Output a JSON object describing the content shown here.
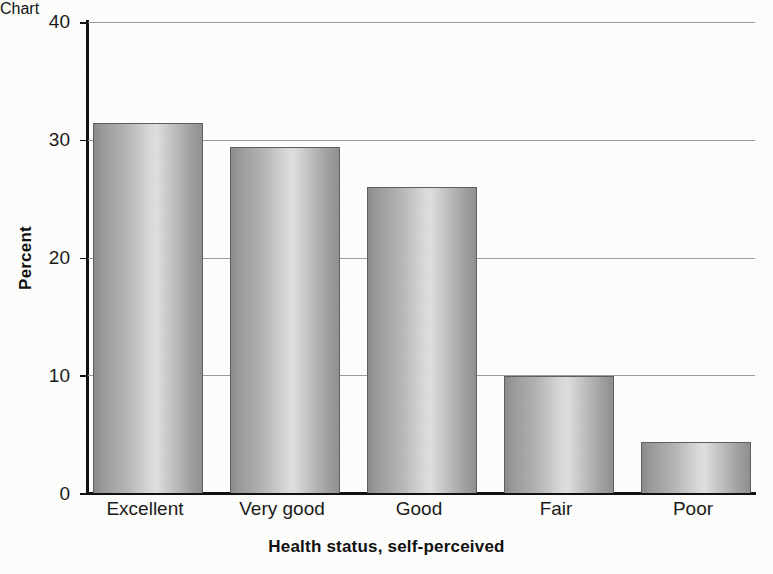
{
  "chart_data": {
    "type": "bar",
    "title": "",
    "xlabel": "Health status, self-perceived",
    "ylabel": "Percent",
    "categories": [
      "Excellent",
      "Very good",
      "Good",
      "Fair",
      "Poor"
    ],
    "values": [
      31.4,
      29.4,
      26.0,
      9.9,
      4.3
    ],
    "ylim": [
      0,
      40
    ],
    "yticks": [
      0,
      10,
      20,
      30,
      40
    ],
    "ytick_labels": [
      "0",
      "10",
      "20",
      "30",
      "40"
    ],
    "grid": true,
    "grid_axis": "y",
    "legend": "none",
    "bar_style": "cylinder-gradient-grayscale",
    "colors": {
      "background": "#fdfdfb",
      "axis": "#111111",
      "gridline": "#9c9c9c",
      "bar_edge": "#5f5f5f",
      "bar_light": "#dedede",
      "bar_dark": "#8b8b8b",
      "text": "#1a1a1a"
    }
  }
}
